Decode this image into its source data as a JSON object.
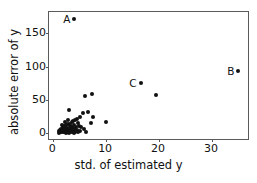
{
  "chart_data": {
    "type": "scatter",
    "title": "",
    "xlabel": "std. of estimated y",
    "ylabel": "absolute error of y",
    "xlim": [
      -0.8,
      37.2
    ],
    "ylim": [
      -12,
      182
    ],
    "xticks": [
      0,
      10,
      20,
      30
    ],
    "xticklabels": [
      "0",
      "10",
      "20",
      "30"
    ],
    "yticks": [
      0,
      50,
      100,
      150
    ],
    "yticklabels": [
      "0",
      "50",
      "100",
      "150"
    ],
    "grid": false,
    "legend": null,
    "marker": "circle",
    "marker_color": "#111111",
    "points": [
      {
        "x": 4.0,
        "y": 172.0,
        "label": "A"
      },
      {
        "x": 35.0,
        "y": 93.0,
        "label": "B"
      },
      {
        "x": 16.5,
        "y": 75.0,
        "label": "C"
      },
      {
        "x": 19.5,
        "y": 57.0,
        "label": ""
      },
      {
        "x": 7.4,
        "y": 59.0,
        "label": ""
      },
      {
        "x": 6.1,
        "y": 55.0,
        "label": ""
      },
      {
        "x": 2.9,
        "y": 34.0,
        "label": ""
      },
      {
        "x": 6.6,
        "y": 31.0,
        "label": ""
      },
      {
        "x": 5.6,
        "y": 30.0,
        "label": ""
      },
      {
        "x": 7.6,
        "y": 24.0,
        "label": ""
      },
      {
        "x": 7.2,
        "y": 15.0,
        "label": ""
      },
      {
        "x": 9.9,
        "y": 17.0,
        "label": ""
      },
      {
        "x": 5.0,
        "y": 24.0,
        "label": ""
      },
      {
        "x": 4.4,
        "y": 21.0,
        "label": ""
      },
      {
        "x": 4.1,
        "y": 19.5,
        "label": ""
      },
      {
        "x": 3.8,
        "y": 18.0,
        "label": ""
      },
      {
        "x": 3.5,
        "y": 16.5,
        "label": ""
      },
      {
        "x": 4.6,
        "y": 15.0,
        "label": ""
      },
      {
        "x": 3.2,
        "y": 14.0,
        "label": ""
      },
      {
        "x": 2.8,
        "y": 13.0,
        "label": ""
      },
      {
        "x": 3.9,
        "y": 12.0,
        "label": ""
      },
      {
        "x": 4.9,
        "y": 11.0,
        "label": ""
      },
      {
        "x": 2.4,
        "y": 11.5,
        "label": ""
      },
      {
        "x": 3.1,
        "y": 10.0,
        "label": ""
      },
      {
        "x": 2.0,
        "y": 10.5,
        "label": ""
      },
      {
        "x": 3.6,
        "y": 9.0,
        "label": ""
      },
      {
        "x": 4.3,
        "y": 8.5,
        "label": ""
      },
      {
        "x": 2.6,
        "y": 8.0,
        "label": ""
      },
      {
        "x": 1.8,
        "y": 8.5,
        "label": ""
      },
      {
        "x": 3.3,
        "y": 7.5,
        "label": ""
      },
      {
        "x": 2.2,
        "y": 7.0,
        "label": ""
      },
      {
        "x": 4.0,
        "y": 6.5,
        "label": ""
      },
      {
        "x": 1.5,
        "y": 6.5,
        "label": ""
      },
      {
        "x": 2.9,
        "y": 6.0,
        "label": ""
      },
      {
        "x": 3.7,
        "y": 5.5,
        "label": ""
      },
      {
        "x": 2.4,
        "y": 5.0,
        "label": ""
      },
      {
        "x": 1.9,
        "y": 5.5,
        "label": ""
      },
      {
        "x": 4.5,
        "y": 5.0,
        "label": ""
      },
      {
        "x": 3.0,
        "y": 4.5,
        "label": ""
      },
      {
        "x": 1.3,
        "y": 4.5,
        "label": ""
      },
      {
        "x": 2.1,
        "y": 4.0,
        "label": ""
      },
      {
        "x": 3.4,
        "y": 3.5,
        "label": ""
      },
      {
        "x": 2.6,
        "y": 3.0,
        "label": ""
      },
      {
        "x": 1.7,
        "y": 3.0,
        "label": ""
      },
      {
        "x": 4.1,
        "y": 3.0,
        "label": ""
      },
      {
        "x": 1.1,
        "y": 3.0,
        "label": ""
      },
      {
        "x": 2.9,
        "y": 2.5,
        "label": ""
      },
      {
        "x": 2.3,
        "y": 2.0,
        "label": ""
      },
      {
        "x": 3.6,
        "y": 2.0,
        "label": ""
      },
      {
        "x": 1.5,
        "y": 2.0,
        "label": ""
      },
      {
        "x": 4.7,
        "y": 2.0,
        "label": ""
      },
      {
        "x": 2.0,
        "y": 1.5,
        "label": ""
      },
      {
        "x": 2.7,
        "y": 1.2,
        "label": ""
      },
      {
        "x": 3.2,
        "y": 1.0,
        "label": ""
      },
      {
        "x": 1.3,
        "y": 1.2,
        "label": ""
      },
      {
        "x": 4.2,
        "y": 1.0,
        "label": ""
      },
      {
        "x": 1.8,
        "y": 0.8,
        "label": ""
      },
      {
        "x": 2.5,
        "y": 0.5,
        "label": ""
      },
      {
        "x": 3.9,
        "y": 0.5,
        "label": ""
      },
      {
        "x": 1.0,
        "y": 0.6,
        "label": ""
      },
      {
        "x": 3.0,
        "y": 0.3,
        "label": ""
      },
      {
        "x": 5.3,
        "y": 9.5,
        "label": ""
      },
      {
        "x": 5.8,
        "y": 6.0,
        "label": ""
      },
      {
        "x": 5.1,
        "y": 2.5,
        "label": ""
      },
      {
        "x": 6.2,
        "y": 2.0,
        "label": ""
      },
      {
        "x": 2.2,
        "y": 16.0,
        "label": ""
      },
      {
        "x": 1.6,
        "y": 12.5,
        "label": ""
      },
      {
        "x": 2.7,
        "y": 19.0,
        "label": ""
      }
    ]
  }
}
